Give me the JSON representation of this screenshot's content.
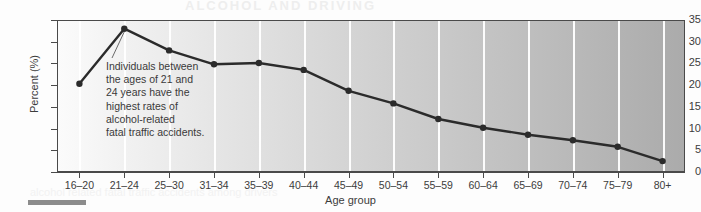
{
  "chart_data": {
    "type": "line",
    "title": "",
    "xlabel": "Age group",
    "ylabel": "Percent (%)",
    "categories": [
      "16–20",
      "21–24",
      "25–30",
      "31–34",
      "35–39",
      "40–44",
      "45–49",
      "50–54",
      "55–59",
      "60–64",
      "65–69",
      "70–74",
      "75–79",
      "80+"
    ],
    "values": [
      20.3,
      33.0,
      28.0,
      24.8,
      25.1,
      23.5,
      18.7,
      15.8,
      12.2,
      10.2,
      8.6,
      7.3,
      5.8,
      2.5
    ],
    "ylim": [
      0,
      35
    ],
    "yticks": [
      0,
      5,
      10,
      15,
      20,
      25,
      30,
      35
    ],
    "ytick_labels": [
      "0",
      "5",
      "10",
      "15",
      "20",
      "25",
      "30",
      "35"
    ],
    "grid": "vertical",
    "legend": "none",
    "series_color": "#2b2b2b",
    "marker": "circle",
    "annotations": [
      {
        "name": "peak-callout",
        "target_category": "21–24",
        "lines": [
          "Individuals between",
          "the ages of 21 and",
          "24 years have the",
          "highest rates of",
          "alcohol-related",
          "fatal traffic accidents."
        ]
      }
    ]
  },
  "figure": {
    "background_gradient_start": "#fbfbfb",
    "background_gradient_end": "#ababab",
    "frame_color": "#4a4a4a",
    "gridline_color": "#ffffff",
    "text_color": "#3c3c3c"
  },
  "bleed": {
    "top_ghost": "ALCOHOL AND DRIVING",
    "bottom_ghost": "alcohol related fatal traffic accidents among drivers"
  }
}
